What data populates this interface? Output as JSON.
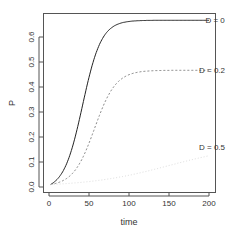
{
  "chart_data": {
    "type": "line",
    "title": "",
    "xlabel": "time",
    "ylabel": "P",
    "xlim": [
      -4,
      208
    ],
    "ylim": [
      -0.02,
      0.7
    ],
    "xticks": [
      0,
      50,
      100,
      150,
      200
    ],
    "xtick_labels": [
      "0",
      "50",
      "100",
      "150",
      "200"
    ],
    "yticks": [
      0.0,
      0.1,
      0.2,
      0.3,
      0.4,
      0.5,
      0.6
    ],
    "ytick_labels": [
      "0.0",
      "0.1",
      "0.2",
      "0.3",
      "0.4",
      "0.5",
      "0.6"
    ],
    "grid": false,
    "legend": "inline labels at right end of curves",
    "series": [
      {
        "name": "D = 0",
        "style": "solid",
        "color": "#222222",
        "plateau": 0.667,
        "midpoint": 42,
        "rate": 0.085,
        "label": "D = 0",
        "label_x": 178,
        "label_y": 0.667
      },
      {
        "name": "D = 0.2",
        "style": "dashed",
        "color": "#888888",
        "plateau": 0.467,
        "midpoint": 57,
        "rate": 0.075,
        "label": "D = 0.2",
        "label_x": 170,
        "label_y": 0.467
      },
      {
        "name": "D = 0.5",
        "style": "dotted",
        "color": "#dddddd",
        "plateau": 0.17,
        "midpoint": 150,
        "rate": 0.02,
        "label": "D = 0.5",
        "label_x": 170,
        "label_y": 0.16
      }
    ],
    "x_range": [
      2,
      200
    ],
    "initial": 0.01
  }
}
